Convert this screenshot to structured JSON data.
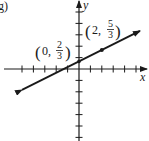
{
  "panel_label": "g)",
  "chart_data": {
    "type": "line",
    "title": "",
    "xlabel": "x",
    "ylabel": "y",
    "equation": "y = (1/2)x + 2/3",
    "slope": 0.5,
    "intercept": 0.6667,
    "xlim": [
      -5.5,
      5.9
    ],
    "ylim": [
      -6.3,
      6.0
    ],
    "grid": false,
    "tick_spacing": 1,
    "tick_labels_shown": false,
    "series": [
      {
        "name": "line",
        "x": [
          -5.0,
          5.35
        ],
        "y": [
          -1.83,
          3.34
        ],
        "arrows": "both"
      }
    ],
    "points": [
      {
        "x": 0,
        "y": 0.6667,
        "label_num": "2",
        "label_den": "3",
        "label_x": "0",
        "marked": false
      },
      {
        "x": 2,
        "y": 1.6667,
        "label_num": "5",
        "label_den": "3",
        "label_x": "2",
        "marked": true
      }
    ],
    "annotations": [
      "(0, 2/3)",
      "(2, 5/3)"
    ]
  },
  "labels": {
    "x_axis": "x",
    "y_axis": "y",
    "p1": {
      "open": "(",
      "x": "0,",
      "num": "2",
      "den": "3",
      "close": ")"
    },
    "p2": {
      "open": "(",
      "x": "2,",
      "num": "5",
      "den": "3",
      "close": ")"
    }
  },
  "colors": {
    "ink": "#1a1a1a",
    "background": "#ffffff"
  }
}
